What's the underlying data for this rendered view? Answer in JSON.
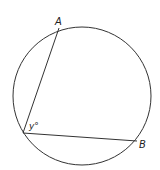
{
  "diagram": {
    "type": "circle-inscribed-angle",
    "points": {
      "A": {
        "label": "A"
      },
      "B": {
        "label": "B"
      }
    },
    "angle_label": "y°",
    "colors": {
      "stroke": "#333333",
      "background": "#ffffff"
    }
  }
}
